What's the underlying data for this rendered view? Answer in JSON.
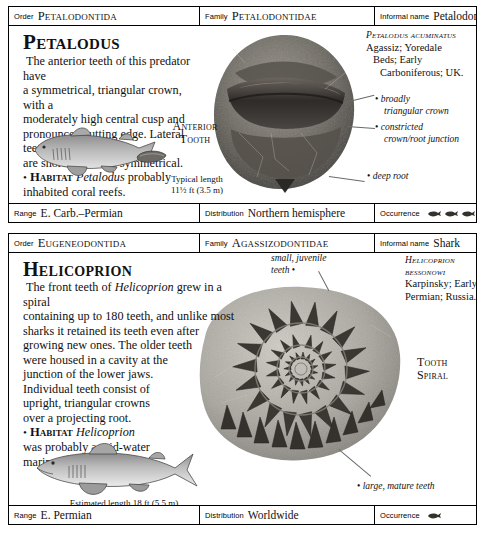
{
  "panels": [
    {
      "header": {
        "order_label": "Order",
        "order_value": "Petalodontida",
        "family_label": "Family",
        "family_value": "Petalodontidae",
        "informal_label": "Informal name",
        "informal_value": "Petalodont"
      },
      "title": "Petalodus",
      "description_line1": "The anterior teeth of this predator have",
      "description_line2": "a symmetrical, triangular crown, with a",
      "description_line3": "moderately high central cusp and",
      "description_line4": "pronounced cutting edge. Lateral teeth",
      "description_line5": "are shorter and less symmetrical.",
      "habitat_bullet": "•",
      "habitat_word": "Habitat",
      "habitat_genus": "Petalodus",
      "habitat_rest": "probably",
      "habitat_line2": "inhabited coral reefs.",
      "caption_label_line1": "Anterior",
      "caption_label_line2": "Tooth",
      "length_label": "Typical length",
      "length_value": "11½ ft (3.5 m)",
      "specimen_binomial": "Petalodus acuminatus",
      "specimen_line1": "Agassiz; Yoredale",
      "specimen_line2": "Beds; Early",
      "specimen_line3": "Carboniferous; UK.",
      "annotations": [
        {
          "line1": "broadly",
          "line2": "triangular crown"
        },
        {
          "line1": "constricted",
          "line2": "crown/root junction"
        },
        {
          "line1": "deep root",
          "line2": ""
        }
      ],
      "footer": {
        "range_label": "Range",
        "range_value": "E. Carb.–Permian",
        "distribution_label": "Distribution",
        "distribution_value": "Northern hemisphere",
        "occurrence_label": "Occurrence",
        "occurrence_icon": "fish-icon",
        "occurrence_count": 5
      }
    },
    {
      "header": {
        "order_label": "Order",
        "order_value": "Eugeneodontida",
        "family_label": "Family",
        "family_value": "Agassizodontidae",
        "informal_label": "Informal name",
        "informal_value": "Shark"
      },
      "title": "Helicoprion",
      "description_line1a": "The front teeth of ",
      "description_genus": "Helicoprion",
      "description_line1b": " grew in a spiral",
      "description_line2": "containing up to 180 teeth, and unlike most",
      "description_line3": "sharks it retained its teeth even after",
      "description_line4": "growing new ones. The older teeth",
      "description_line5": "were housed in a cavity at the",
      "description_line6": "junction of the lower jaws.",
      "description_line7": "Individual teeth consist of",
      "description_line8": "upright, triangular crowns",
      "description_line9": "over a projecting root.",
      "habitat_bullet": "•",
      "habitat_word": "Habitat",
      "habitat_genus": "Helicoprion",
      "habitat_line2": "was probably a mid-water",
      "habitat_line3": "marine predator.",
      "caption_label_line1": "Tooth",
      "caption_label_line2": "Spiral",
      "length_value": "Estimated length 18 ft (5.5 m)",
      "specimen_binomial_line1": "Helicoprion",
      "specimen_binomial_line2": "bessonowi",
      "specimen_line1": "Karpinsky; Early",
      "specimen_line2": "Permian; Russia.",
      "annotations": [
        {
          "line1": "small, juvenile",
          "line2": "teeth"
        },
        {
          "line1": "large, mature teeth",
          "line2": ""
        }
      ],
      "footer": {
        "range_label": "Range",
        "range_value": "E. Permian",
        "distribution_label": "Distribution",
        "distribution_value": "Worldwide",
        "occurrence_label": "Occurrence",
        "occurrence_icon": "fish-icon",
        "occurrence_count": 1
      }
    }
  ],
  "colors": {
    "border": "#000000",
    "text": "#111111",
    "leader": "#6a6a6a",
    "fossil_dark": "#4b4b4b",
    "fossil_mid": "#8d8d8d",
    "fossil_light": "#c2c2c2",
    "background": "#ffffff"
  }
}
